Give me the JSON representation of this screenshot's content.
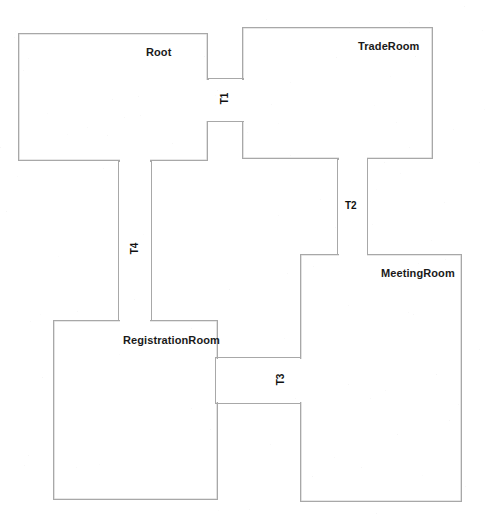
{
  "diagram": {
    "type": "floorplan",
    "line_color": "#a8a8a8",
    "text_color": "#1a1a1a",
    "background": "#ffffff",
    "rooms": [
      {
        "id": "root",
        "label": "Root",
        "x": 18,
        "y": 33,
        "w": 190,
        "h": 128,
        "label_x": 146,
        "label_y": 46
      },
      {
        "id": "trade-room",
        "label": "TradeRoom",
        "x": 242,
        "y": 27,
        "w": 191,
        "h": 132,
        "label_x": 358,
        "label_y": 40
      },
      {
        "id": "registration-room",
        "label": "RegistrationRoom",
        "x": 53,
        "y": 320,
        "w": 165,
        "h": 180,
        "label_x": 123,
        "label_y": 334
      },
      {
        "id": "meeting-room",
        "label": "MeetingRoom",
        "x": 300,
        "y": 254,
        "w": 162,
        "h": 248,
        "label_x": 381,
        "label_y": 267
      }
    ],
    "corridors": [
      {
        "id": "t1",
        "label": "T1",
        "x": 208,
        "y": 78,
        "w": 36,
        "h": 44,
        "orientation": "vertical",
        "connects": [
          "root",
          "trade-room"
        ],
        "label_x": 219,
        "label_y": 93
      },
      {
        "id": "t2",
        "label": "T2",
        "x": 337,
        "y": 159,
        "w": 31,
        "h": 96,
        "orientation": "vertical",
        "connects": [
          "trade-room",
          "meeting-room"
        ],
        "label_x": 345,
        "label_y": 200
      },
      {
        "id": "t3",
        "label": "T3",
        "x": 215,
        "y": 357,
        "w": 86,
        "h": 47,
        "orientation": "horizontal",
        "connects": [
          "registration-room",
          "meeting-room"
        ],
        "label_x": 275,
        "label_y": 374
      },
      {
        "id": "t4",
        "label": "T4",
        "x": 118,
        "y": 161,
        "w": 34,
        "h": 160,
        "orientation": "vertical",
        "connects": [
          "root",
          "registration-room"
        ],
        "label_x": 129,
        "label_y": 243
      }
    ]
  }
}
